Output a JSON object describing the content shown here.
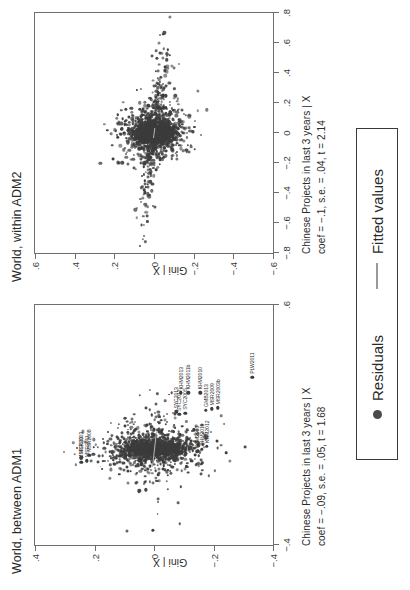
{
  "figure": {
    "orientation": "rotated-90-ccw",
    "panels": [
      {
        "id": "adm1",
        "title": "World, between ADM1",
        "xlabel_line1": "Chinese Projects in last 3 years | X",
        "xlabel_line2": "coef = −.09, s.e. = .05, t = 1.68",
        "ylabel": "Gini | X",
        "xticks": [
          "−.4",
          "",
          ".6"
        ],
        "yticks": [
          ".4",
          ".2",
          "0",
          "−.2",
          "−.4"
        ]
      },
      {
        "id": "adm2",
        "title": "World, within ADM2",
        "xlabel_line1": "Chinese Projects in last 3 years | X",
        "xlabel_line2": "coef = −.1, s.e. = .04, t = 2.14",
        "ylabel": "Gini | X",
        "xticks": [
          "−.8",
          "−.6",
          "−.4",
          "−.2",
          "0",
          ".2",
          ".4",
          ".6",
          ".8"
        ],
        "yticks": [
          ".6",
          ".4",
          ".2",
          "0",
          "−.2",
          "−.4",
          "−.6"
        ]
      }
    ]
  },
  "legend": {
    "residuals_label": "Residuals",
    "fitted_label": "Fitted values",
    "residuals_color": "#4a4a4a",
    "fitted_color": "#9a9a9a"
  },
  "chart_data": {
    "type": "scatter",
    "title": "",
    "panels": [
      {
        "name": "World, between ADM1",
        "type": "scatter",
        "xlabel": "Chinese Projects in last 3 years | X",
        "ylabel": "Gini | X",
        "xlim": [
          -0.4,
          0.6
        ],
        "ylim": [
          -0.4,
          0.4
        ],
        "xticks": [
          -0.4,
          0.6
        ],
        "yticks": [
          0.4,
          0.2,
          0,
          -0.2,
          -0.4
        ],
        "grid": false,
        "fit": {
          "coef": -0.09,
          "se": 0.05,
          "t": 1.68,
          "label": "Fitted values"
        },
        "annotation": "coef = −.09, s.e. = .05, t = 1.68",
        "series": [
          {
            "name": "Residuals",
            "marker": "circle",
            "color": "#3c3c3c"
          }
        ],
        "labeled_points": [
          {
            "label": "MSR2013",
            "x": -0.055,
            "y": 0.245
          },
          {
            "label": "MSR2003",
            "x": -0.035,
            "y": 0.245
          },
          {
            "label": "MSR2011",
            "x": -0.048,
            "y": 0.225
          },
          {
            "label": "MSR2008",
            "x": -0.025,
            "y": 0.218
          },
          {
            "label": "KHM2003",
            "x": -0.01,
            "y": -0.145
          },
          {
            "label": "KHM2011",
            "x": 0.0,
            "y": -0.16
          },
          {
            "label": "KHM2012",
            "x": 0.012,
            "y": -0.178
          },
          {
            "label": "KHM2013",
            "x": 0.235,
            "y": -0.09
          },
          {
            "label": "KHM2011b",
            "x": 0.235,
            "y": -0.115
          },
          {
            "label": "KHM2010",
            "x": 0.235,
            "y": -0.155
          },
          {
            "label": "SYC2012",
            "x": 0.145,
            "y": -0.085
          },
          {
            "label": "SYC2013",
            "x": 0.155,
            "y": -0.075
          },
          {
            "label": "SYC2005",
            "x": 0.15,
            "y": -0.105
          },
          {
            "label": "GMB2013",
            "x": 0.162,
            "y": -0.175
          },
          {
            "label": "MSR2009",
            "x": 0.168,
            "y": -0.195
          },
          {
            "label": "MSR2003b",
            "x": 0.172,
            "y": -0.215
          },
          {
            "label": "PLW2011",
            "x": 0.3,
            "y": -0.33
          }
        ],
        "n_points_approx": 1800
      },
      {
        "name": "World, within ADM2",
        "type": "scatter",
        "xlabel": "Chinese Projects in last 3 years | X",
        "ylabel": "Gini | X",
        "xlim": [
          -0.8,
          0.8
        ],
        "ylim": [
          -0.6,
          0.6
        ],
        "xticks": [
          -0.8,
          -0.6,
          -0.4,
          -0.2,
          0,
          0.2,
          0.4,
          0.6,
          0.8
        ],
        "yticks": [
          0.6,
          0.4,
          0.2,
          0,
          -0.2,
          -0.4,
          -0.6
        ],
        "grid": false,
        "fit": {
          "coef": -0.1,
          "se": 0.04,
          "t": 2.14,
          "label": "Fitted values"
        },
        "annotation": "coef = −.1, s.e. = .04, t = 2.14",
        "series": [
          {
            "name": "Residuals",
            "marker": "circle",
            "color": "#3c3c3c"
          }
        ],
        "labeled_points": [],
        "n_points_approx": 2600
      }
    ]
  }
}
